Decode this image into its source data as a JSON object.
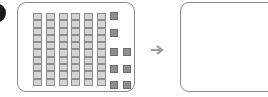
{
  "diagram": {
    "type": "base-ten-blocks",
    "represented_number": 68,
    "tens_rods": 6,
    "units_per_rod": 10,
    "ones_cubes": 8,
    "ones_layout": [
      [
        true,
        false
      ],
      [
        true,
        false
      ],
      [
        true,
        true
      ],
      [
        true,
        true
      ],
      [
        true,
        true
      ]
    ],
    "colors": {
      "rod_fill": "#d4d4d4",
      "rod_border": "#8d8d8d",
      "cube_fill": "#8f8f8f",
      "cube_border": "#6d6d6d",
      "panel_border": "#8a8a8a",
      "arrow": "#9a9a9a"
    },
    "arrow_icon": "arrow-right-icon",
    "answer_box": ""
  }
}
